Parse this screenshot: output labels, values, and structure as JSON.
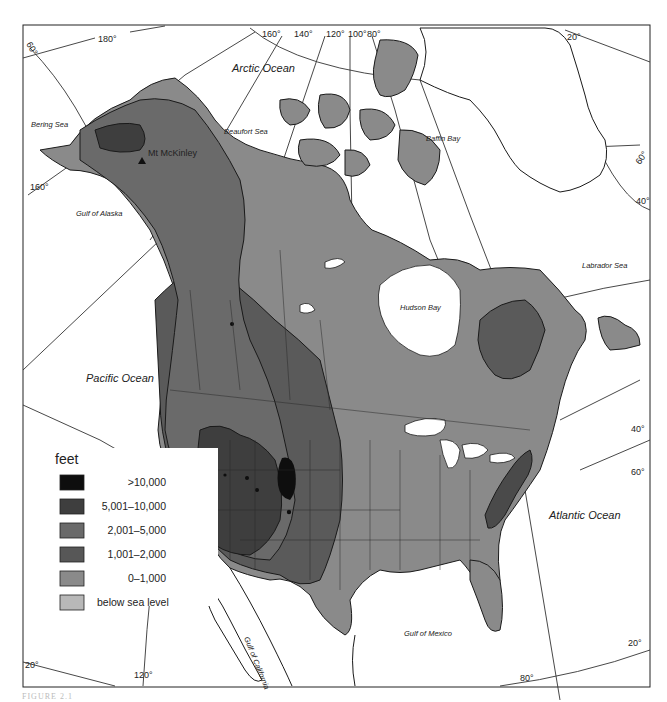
{
  "map": {
    "title": "North America relief map",
    "oceans": [
      {
        "id": "arctic",
        "label": "Arctic Ocean"
      },
      {
        "id": "pacific",
        "label": "Pacific Ocean"
      },
      {
        "id": "atlantic",
        "label": "Atlantic Ocean"
      }
    ],
    "seas": [
      {
        "id": "bering",
        "label": "Bering Sea"
      },
      {
        "id": "beaufort",
        "label": "Beaufort Sea"
      },
      {
        "id": "baffin",
        "label": "Baffin Bay"
      },
      {
        "id": "alaska",
        "label": "Gulf of Alaska"
      },
      {
        "id": "labrador",
        "label": "Labrador Sea"
      },
      {
        "id": "hudson",
        "label": "Hudson Bay"
      },
      {
        "id": "mexico",
        "label": "Gulf of Mexico"
      },
      {
        "id": "california",
        "label": "Gulf of California"
      }
    ],
    "peak": {
      "label": "Mt McKinley",
      "icon": "triangle-peak-icon"
    },
    "graticule_labels": {
      "top": [
        "180°",
        "160°",
        "140°",
        "120°",
        "100°",
        "80°",
        "20°"
      ],
      "left": [
        "60°",
        "160°"
      ],
      "right": [
        "60°",
        "40°",
        "40°",
        "60°"
      ],
      "bottom": [
        "20°",
        "120°",
        "80°",
        "20°"
      ]
    }
  },
  "legend": {
    "title": "feet",
    "items": [
      {
        "label": ">10,000",
        "color": "#0e0e0e"
      },
      {
        "label": "5,001–10,000",
        "color": "#3e3e3e"
      },
      {
        "label": "2,001–5,000",
        "color": "#6a6a6a"
      },
      {
        "label": "1,001–2,000",
        "color": "#575757"
      },
      {
        "label": "0–1,000",
        "color": "#8a8a8a"
      },
      {
        "label": "below sea level",
        "color": "#b8b8b8"
      }
    ]
  },
  "caption": "FIGURE 2.1"
}
